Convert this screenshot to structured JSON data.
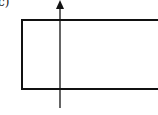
{
  "figure": {
    "label": "c)",
    "elements": [
      {
        "type": "rectangle",
        "description": "horizontal rectangle"
      },
      {
        "type": "arrow",
        "direction": "up",
        "description": "vertical arrow crossing the rectangle"
      }
    ]
  },
  "colors": {
    "stroke": "#111111",
    "background": "#ffffff"
  }
}
